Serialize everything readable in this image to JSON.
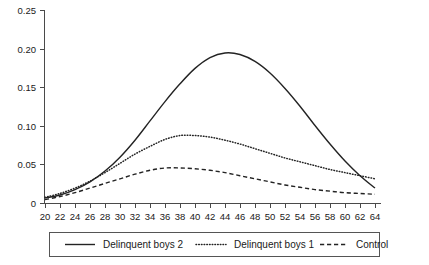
{
  "chart_data": {
    "type": "line",
    "title": "",
    "xlabel": "",
    "ylabel": "",
    "xlim": [
      20,
      64
    ],
    "ylim": [
      0,
      0.25
    ],
    "grid": false,
    "legend_position": "bottom",
    "x_ticks": [
      20,
      22,
      24,
      26,
      28,
      30,
      32,
      34,
      36,
      38,
      40,
      42,
      44,
      46,
      48,
      50,
      52,
      54,
      56,
      58,
      60,
      62,
      64
    ],
    "y_ticks": [
      0,
      0.05,
      0.1,
      0.15,
      0.2,
      0.25
    ],
    "x_tick_labels": [
      "20",
      "22",
      "24",
      "26",
      "28",
      "30",
      "32",
      "34",
      "36",
      "38",
      "40",
      "42",
      "44",
      "46",
      "48",
      "50",
      "52",
      "54",
      "56",
      "58",
      "60",
      "62",
      "64"
    ],
    "y_tick_labels": [
      "0",
      "0.05",
      "0.10",
      "0.15",
      "0.20",
      "0.25"
    ],
    "x": [
      20,
      22,
      24,
      26,
      28,
      30,
      32,
      34,
      36,
      38,
      40,
      42,
      44,
      46,
      48,
      50,
      52,
      54,
      56,
      58,
      60,
      62,
      64
    ],
    "series": [
      {
        "name": "Delinquent boys 2",
        "style": "solid",
        "color": "#232323",
        "values": [
          0.007,
          0.011,
          0.018,
          0.028,
          0.042,
          0.06,
          0.082,
          0.107,
          0.132,
          0.155,
          0.175,
          0.189,
          0.195,
          0.193,
          0.184,
          0.169,
          0.149,
          0.126,
          0.101,
          0.077,
          0.055,
          0.036,
          0.02
        ]
      },
      {
        "name": "Delinquent boys 1",
        "style": "dotted",
        "color": "#232323",
        "values": [
          0.008,
          0.013,
          0.02,
          0.029,
          0.04,
          0.052,
          0.064,
          0.074,
          0.083,
          0.088,
          0.088,
          0.086,
          0.082,
          0.077,
          0.071,
          0.065,
          0.059,
          0.054,
          0.049,
          0.044,
          0.04,
          0.036,
          0.032
        ]
      },
      {
        "name": "Control",
        "style": "dashed",
        "color": "#232323",
        "values": [
          0.005,
          0.009,
          0.014,
          0.02,
          0.026,
          0.032,
          0.038,
          0.043,
          0.046,
          0.046,
          0.045,
          0.043,
          0.04,
          0.036,
          0.032,
          0.028,
          0.024,
          0.021,
          0.018,
          0.016,
          0.014,
          0.013,
          0.012
        ]
      }
    ],
    "legend_entries": [
      {
        "label": "Delinquent boys 2",
        "style": "solid"
      },
      {
        "label": "Delinquent boys 1",
        "style": "dotted"
      },
      {
        "label": "Control",
        "style": "dashed"
      }
    ]
  }
}
